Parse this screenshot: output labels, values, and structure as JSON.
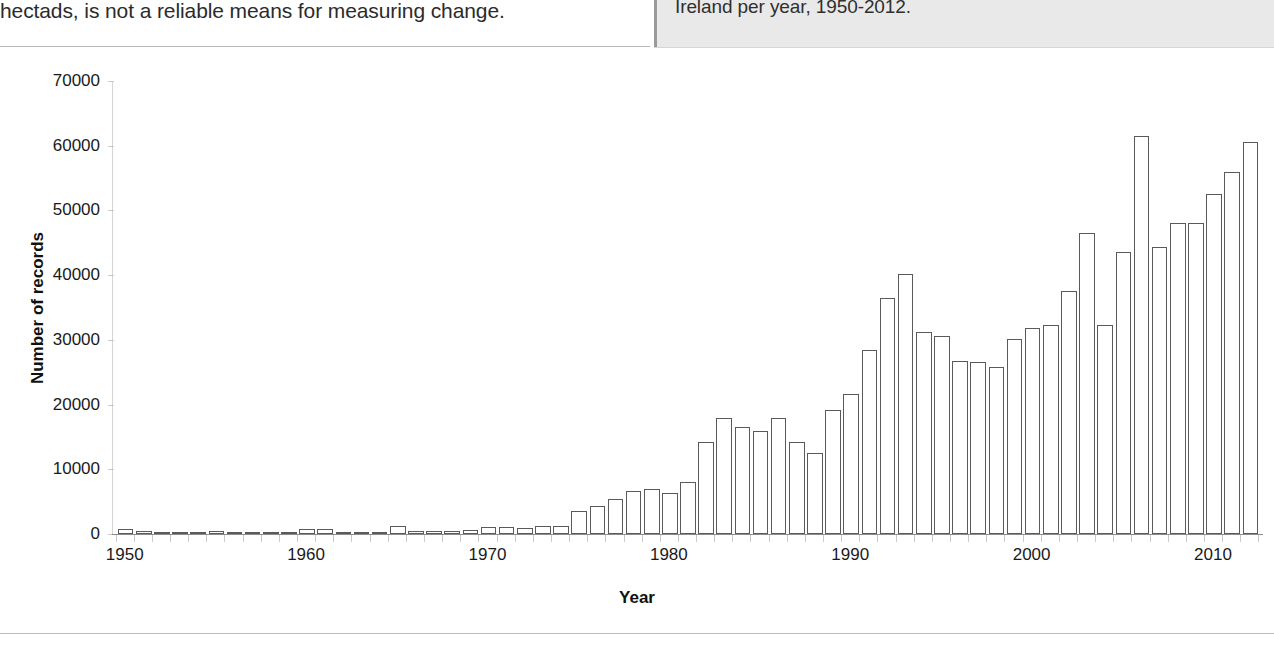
{
  "page": {
    "body_text_fragment": "hectads, is not a reliable means for measuring change.",
    "caption": "Ireland per year, 1950-2012."
  },
  "chart_data": {
    "type": "bar",
    "title": "",
    "xlabel": "Year",
    "ylabel": "Number of records",
    "ylim": [
      0,
      70000
    ],
    "xlim": [
      1949.3,
      2012.7
    ],
    "grid": false,
    "legend": null,
    "ytick_labels": [
      "70000",
      "60000",
      "50000",
      "40000",
      "30000",
      "20000",
      "10000",
      "0"
    ],
    "ytick_values": [
      70000,
      60000,
      50000,
      40000,
      30000,
      20000,
      10000,
      0
    ],
    "xtick_labels": [
      "1950",
      "1960",
      "1970",
      "1980",
      "1990",
      "2000",
      "2010"
    ],
    "xtick_values": [
      1950,
      1960,
      1970,
      1980,
      1990,
      2000,
      2010
    ],
    "bar_edge_color": "#5a5a5a",
    "bar_fill_color": "#ffffff",
    "categories": [
      1950,
      1951,
      1952,
      1953,
      1954,
      1955,
      1956,
      1957,
      1958,
      1959,
      1960,
      1961,
      1962,
      1963,
      1964,
      1965,
      1966,
      1967,
      1968,
      1969,
      1970,
      1971,
      1972,
      1973,
      1974,
      1975,
      1976,
      1977,
      1978,
      1979,
      1980,
      1981,
      1982,
      1983,
      1984,
      1985,
      1986,
      1987,
      1988,
      1989,
      1990,
      1991,
      1992,
      1993,
      1994,
      1995,
      1996,
      1997,
      1998,
      1999,
      2000,
      2001,
      2002,
      2003,
      2004,
      2005,
      2006,
      2007,
      2008,
      2009,
      2010,
      2011,
      2012
    ],
    "values": [
      700,
      400,
      350,
      350,
      350,
      500,
      350,
      300,
      300,
      350,
      800,
      700,
      250,
      250,
      300,
      1300,
      500,
      450,
      500,
      600,
      1100,
      1100,
      900,
      1200,
      1200,
      3600,
      4400,
      5400,
      6700,
      7000,
      6300,
      8100,
      14200,
      18000,
      16600,
      15900,
      18000,
      14200,
      12500,
      19200,
      21600,
      28400,
      36500,
      40200,
      31200,
      30600,
      26700,
      26600,
      25800,
      30100,
      31900,
      32300,
      37500,
      46500,
      32300,
      43600,
      61500,
      44300,
      48000,
      48000,
      52500,
      56000,
      60500
    ]
  }
}
